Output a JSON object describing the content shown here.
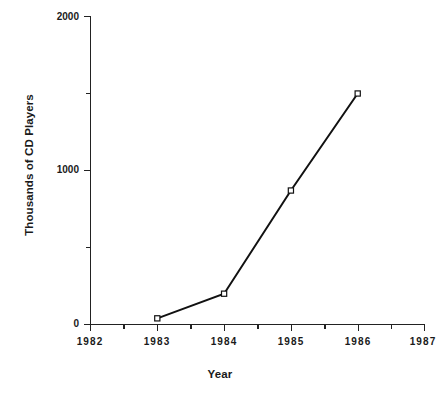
{
  "chart_data": {
    "type": "line",
    "title": "",
    "xlabel": "Year",
    "ylabel": "Thousands of CD Players",
    "x": [
      1983,
      1984,
      1985,
      1986
    ],
    "values": [
      40,
      200,
      870,
      1500
    ],
    "series": [
      {
        "name": "CD Players",
        "x": [
          1983,
          1984,
          1985,
          1986
        ],
        "values": [
          40,
          200,
          870,
          1500
        ]
      }
    ],
    "xlim": [
      1982,
      1987
    ],
    "ylim": [
      0,
      2000
    ],
    "x_tick_labels": [
      "1982",
      "1983",
      "1984",
      "1985",
      "1986",
      "1987"
    ],
    "x_tick_values": [
      1982,
      1983,
      1984,
      1985,
      1986,
      1987
    ],
    "x_minor_ticks": [
      1982.5,
      1983.5,
      1984.5,
      1985.5,
      1986.5
    ],
    "y_tick_labels": [
      "0",
      "1000",
      "2000"
    ],
    "y_tick_values": [
      0,
      1000,
      2000
    ],
    "y_minor_ticks": [
      500,
      1500
    ],
    "grid": false,
    "legend": "none",
    "marker": "open-square",
    "line_color": "#111111",
    "marker_fill": "#ffffff",
    "background": "#ffffff"
  },
  "axes": {
    "y_title": "Thousands of CD Players",
    "x_title": "Year"
  }
}
